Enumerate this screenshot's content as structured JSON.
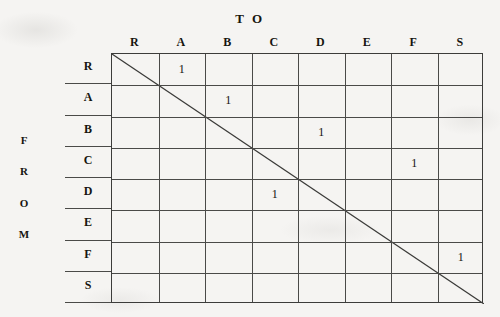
{
  "title": "T O",
  "from_label": [
    "F",
    "R",
    "O",
    "M"
  ],
  "columns": [
    "R",
    "A",
    "B",
    "C",
    "D",
    "E",
    "F",
    "S"
  ],
  "rows": [
    "R",
    "A",
    "B",
    "C",
    "D",
    "E",
    "F",
    "S"
  ],
  "colors": {
    "background": "#f5f4f2",
    "ink": "#16140f",
    "rule": "#4a4a48",
    "border": "#3c3c3a"
  },
  "chart_data": {
    "type": "heatmap",
    "title": "T O",
    "xlabel": "T O",
    "ylabel": "F R O M",
    "categories": [
      "R",
      "A",
      "B",
      "C",
      "D",
      "E",
      "F",
      "S"
    ],
    "rows": [
      "R",
      "A",
      "B",
      "C",
      "D",
      "E",
      "F",
      "S"
    ],
    "grid": true,
    "legend": "none",
    "annotations": [
      "diagonal line from top-left corner to bottom-right corner"
    ],
    "matrix": [
      [
        null,
        "1",
        null,
        null,
        null,
        null,
        null,
        null
      ],
      [
        null,
        null,
        "1",
        null,
        null,
        null,
        null,
        null
      ],
      [
        null,
        null,
        null,
        null,
        "1",
        null,
        null,
        null
      ],
      [
        null,
        null,
        null,
        null,
        null,
        null,
        "1",
        null
      ],
      [
        null,
        null,
        null,
        "1",
        null,
        null,
        null,
        null
      ],
      [
        null,
        null,
        null,
        null,
        null,
        null,
        null,
        null
      ],
      [
        null,
        null,
        null,
        null,
        null,
        null,
        null,
        "1"
      ],
      [
        null,
        null,
        null,
        null,
        null,
        null,
        null,
        null
      ]
    ],
    "cells": [
      {
        "from": "R",
        "to": "A",
        "value": "1"
      },
      {
        "from": "A",
        "to": "B",
        "value": "1"
      },
      {
        "from": "B",
        "to": "D",
        "value": "1"
      },
      {
        "from": "C",
        "to": "F",
        "value": "1"
      },
      {
        "from": "D",
        "to": "C",
        "value": "1"
      },
      {
        "from": "F",
        "to": "S",
        "value": "1"
      }
    ]
  }
}
